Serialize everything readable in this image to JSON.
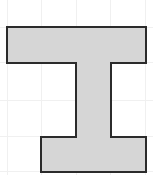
{
  "canvas": {
    "width": 153,
    "height": 175,
    "background_color": "#ffffff",
    "title": "I-beam polygon figure"
  },
  "grid": {
    "visible": true,
    "line_color": "#f0f0f0",
    "line_width": 1,
    "spacing_px": 34.5,
    "vertical_lines_x": [
      7,
      41.5,
      76,
      110.5,
      145
    ],
    "horizontal_lines_y": [
      27,
      62,
      100,
      136,
      171
    ]
  },
  "shape": {
    "name": "i-beam",
    "fill_color": "#d6d6d6",
    "stroke_color": "#2b2b2b",
    "stroke_width": 2,
    "points": "7,27 146,27 146,63 111,63 111,137 146,137 146,172 41,172 41,137 76,137 76,63 7,63",
    "vertices": [
      {
        "x": 7,
        "y": 27
      },
      {
        "x": 146,
        "y": 27
      },
      {
        "x": 146,
        "y": 63
      },
      {
        "x": 111,
        "y": 63
      },
      {
        "x": 111,
        "y": 137
      },
      {
        "x": 146,
        "y": 137
      },
      {
        "x": 146,
        "y": 172
      },
      {
        "x": 41,
        "y": 172
      },
      {
        "x": 41,
        "y": 137
      },
      {
        "x": 76,
        "y": 137
      },
      {
        "x": 76,
        "y": 63
      },
      {
        "x": 7,
        "y": 63
      }
    ],
    "parts": {
      "top_flange": {
        "x": 7,
        "y": 27,
        "width": 139,
        "height": 36
      },
      "web": {
        "x": 76,
        "y": 63,
        "width": 35,
        "height": 74
      },
      "bottom_flange": {
        "x": 41,
        "y": 137,
        "width": 105,
        "height": 35
      }
    }
  }
}
